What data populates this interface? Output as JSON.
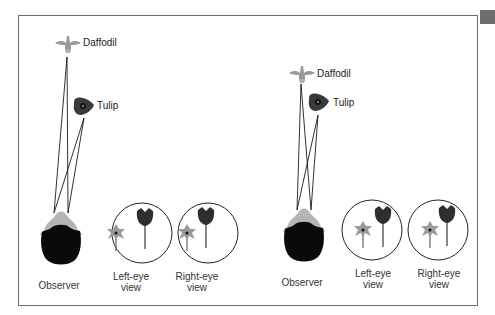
{
  "figure": {
    "panels": [
      {
        "id": "near",
        "flowers": {
          "daffodil_label": "Daffodil",
          "tulip_label": "Tulip"
        },
        "observer_label": "Observer",
        "views": [
          {
            "line1": "Left-eye",
            "line2": "view"
          },
          {
            "line1": "Right-eye",
            "line2": "view"
          }
        ]
      },
      {
        "id": "far",
        "flowers": {
          "daffodil_label": "Daffodil",
          "tulip_label": "Tulip"
        },
        "observer_label": "Observer",
        "views": [
          {
            "line1": "Left-eye",
            "line2": "view"
          },
          {
            "line1": "Right-eye",
            "line2": "view"
          }
        ]
      }
    ],
    "colors": {
      "frame": "#6a6a6a",
      "daffodil": "#9a9a9a",
      "tulip": "#3a3a3a",
      "head_hair": "#0a0a0a",
      "head_skin": "#b5b5b5",
      "lines": "#1a1a1a"
    }
  }
}
